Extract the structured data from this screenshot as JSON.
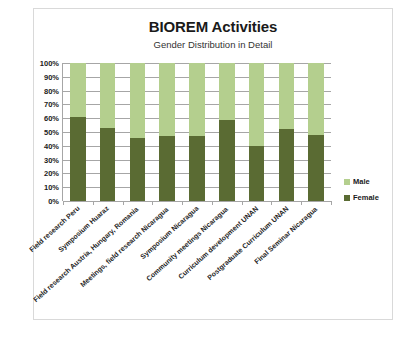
{
  "chart_data": {
    "type": "bar",
    "subtype": "stacked-100-percent",
    "title": "BIOREM Activities",
    "subtitle": "Gender Distribution in Detail",
    "xlabel": "",
    "ylabel": "",
    "ylim": [
      0,
      100
    ],
    "yticks": [
      "0%",
      "10%",
      "20%",
      "30%",
      "40%",
      "50%",
      "60%",
      "70%",
      "80%",
      "90%",
      "100%"
    ],
    "ytick_values": [
      0,
      10,
      20,
      30,
      40,
      50,
      60,
      70,
      80,
      90,
      100
    ],
    "grid": true,
    "legend_position": "right",
    "categories": [
      "Field research Peru",
      "Symposium Huaraz",
      "Field research Austria, Hungary, Romania",
      "Meetings, field research Nicaragua",
      "Symposium Nicaragua",
      "Community meetings Nicaragua",
      "Curriculum development UNAN",
      "Postgraduate Curriculum UNAN",
      "Final Seminar Nicaragua"
    ],
    "series": [
      {
        "name": "Female",
        "color": "#5a6b33",
        "values": [
          61,
          53,
          46,
          47,
          47,
          59,
          40,
          52,
          48
        ]
      },
      {
        "name": "Male",
        "color": "#b4cf8e",
        "values": [
          39,
          47,
          54,
          53,
          53,
          41,
          60,
          48,
          52
        ]
      }
    ],
    "legend": [
      {
        "label": "Male",
        "color": "#b4cf8e"
      },
      {
        "label": "Female",
        "color": "#5a6b33"
      }
    ]
  }
}
